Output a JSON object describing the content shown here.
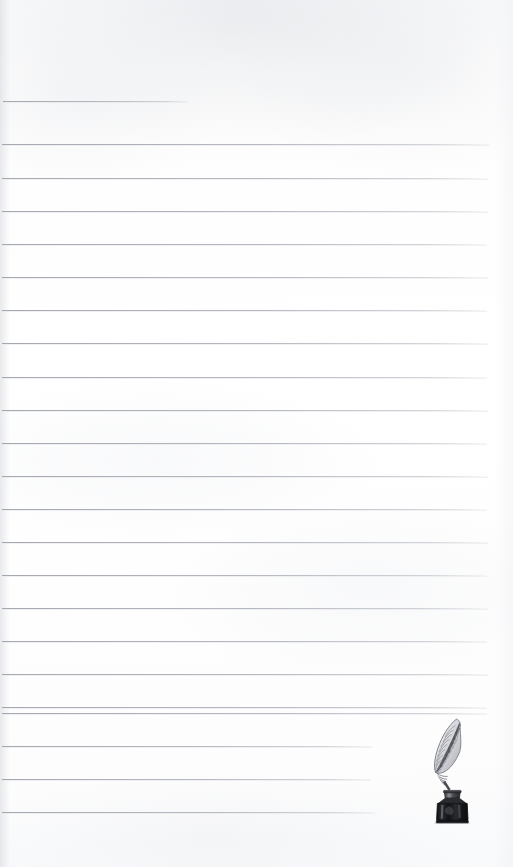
{
  "document": {
    "kind": "scanned-lined-notepaper",
    "title": "Blank ruled notepaper page with quill pen and inkwell illustration",
    "page_width": 513,
    "page_height": 867,
    "paper_color": "#fdfdfd",
    "rule_color": "#a3a6ad",
    "written_text": "",
    "annotations": []
  },
  "ruled_lines": {
    "count": 23,
    "left_margin": 3,
    "full_right_edge": 488,
    "lines": [
      {
        "index": 1,
        "y": 101,
        "x_start": 3,
        "x_end": 188,
        "note": "short top rule"
      },
      {
        "index": 2,
        "y": 144,
        "x_start": 2,
        "x_end": 489,
        "note": "full width"
      },
      {
        "index": 3,
        "y": 178,
        "x_start": 2,
        "x_end": 488,
        "note": "full width"
      },
      {
        "index": 4,
        "y": 211,
        "x_start": 2,
        "x_end": 488,
        "note": "full width"
      },
      {
        "index": 5,
        "y": 244,
        "x_start": 2,
        "x_end": 487,
        "note": "full width"
      },
      {
        "index": 6,
        "y": 277,
        "x_start": 2,
        "x_end": 488,
        "note": "full width"
      },
      {
        "index": 7,
        "y": 310,
        "x_start": 2,
        "x_end": 487,
        "note": "full width"
      },
      {
        "index": 8,
        "y": 343,
        "x_start": 2,
        "x_end": 488,
        "note": "full width"
      },
      {
        "index": 9,
        "y": 377,
        "x_start": 2,
        "x_end": 487,
        "note": "full width"
      },
      {
        "index": 10,
        "y": 410,
        "x_start": 2,
        "x_end": 488,
        "note": "full width"
      },
      {
        "index": 11,
        "y": 443,
        "x_start": 2,
        "x_end": 487,
        "note": "full width"
      },
      {
        "index": 12,
        "y": 476,
        "x_start": 2,
        "x_end": 488,
        "note": "full width"
      },
      {
        "index": 13,
        "y": 509,
        "x_start": 2,
        "x_end": 487,
        "note": "full width"
      },
      {
        "index": 14,
        "y": 542,
        "x_start": 2,
        "x_end": 488,
        "note": "full width"
      },
      {
        "index": 15,
        "y": 575,
        "x_start": 2,
        "x_end": 487,
        "note": "full width"
      },
      {
        "index": 16,
        "y": 608,
        "x_start": 2,
        "x_end": 488,
        "note": "full width"
      },
      {
        "index": 17,
        "y": 641,
        "x_start": 2,
        "x_end": 487,
        "note": "full width"
      },
      {
        "index": 18,
        "y": 674,
        "x_start": 2,
        "x_end": 488,
        "note": "full width"
      },
      {
        "index": 19,
        "y": 707,
        "x_start": 2,
        "x_end": 487,
        "note": "full width"
      },
      {
        "index": 20,
        "y": 713,
        "x_start": 2,
        "x_end": 487,
        "note": "full width near illustration"
      },
      {
        "index": 21,
        "y": 746,
        "x_start": 2,
        "x_end": 372,
        "note": "stops left of quill illustration"
      },
      {
        "index": 22,
        "y": 779,
        "x_start": 2,
        "x_end": 371,
        "note": "stops left of quill illustration"
      },
      {
        "index": 23,
        "y": 812,
        "x_start": 2,
        "x_end": 375,
        "note": "stops left of quill illustration"
      }
    ]
  },
  "illustration": {
    "name": "quill-and-inkwell",
    "description": "Engraved-style drawing of a feather quill pen standing in a dark glass ink bottle",
    "x": 425,
    "y": 716,
    "width": 62,
    "height": 108,
    "parts": [
      {
        "name": "feather-vane",
        "color": "#8d8f95"
      },
      {
        "name": "feather-shaft",
        "color": "#5e6066"
      },
      {
        "name": "ink-bottle-neck",
        "color": "#3a3b3f"
      },
      {
        "name": "ink-bottle-body",
        "color": "#1b1c1f"
      },
      {
        "name": "ink-bottle-highlight",
        "color": "#9a9ba0"
      }
    ]
  }
}
